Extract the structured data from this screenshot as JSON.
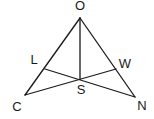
{
  "diagram": {
    "type": "geometry-figure",
    "points": {
      "O": {
        "label": "O"
      },
      "C": {
        "label": "C"
      },
      "N": {
        "label": "N"
      },
      "L": {
        "label": "L"
      },
      "W": {
        "label": "W"
      },
      "S": {
        "label": "S"
      }
    },
    "segments": [
      {
        "from": "O",
        "to": "C"
      },
      {
        "from": "O",
        "to": "N"
      },
      {
        "from": "O",
        "to": "S"
      },
      {
        "from": "L",
        "to": "N"
      },
      {
        "from": "C",
        "to": "W"
      }
    ],
    "line_color": "#1a1a1a",
    "background": "#ffffff"
  }
}
